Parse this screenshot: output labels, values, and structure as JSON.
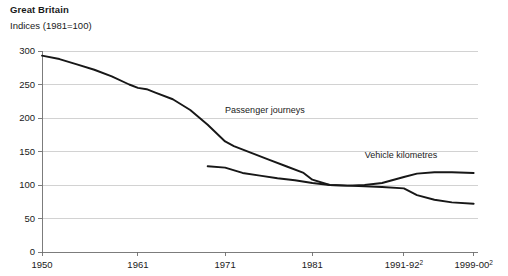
{
  "header": {
    "title": "Great Britain",
    "subtitle": "Indices (1981=100)"
  },
  "chart_data": {
    "type": "line",
    "title": "Great Britain",
    "subtitle": "Indices (1981=100)",
    "xlabel": "",
    "ylabel": "",
    "ylim": [
      0,
      300
    ],
    "yticks": [
      0,
      50,
      100,
      150,
      200,
      250,
      300
    ],
    "ytick_labels": [
      "0",
      "50",
      "100",
      "150",
      "200",
      "250",
      "300"
    ],
    "xticks": [
      1950,
      1961,
      1971,
      1981,
      1991.5,
      1999.5
    ],
    "xtick_labels": [
      "1950",
      "1961",
      "1971",
      "1981",
      "1991-92",
      "1999-00"
    ],
    "xtick_superscripts": [
      "",
      "",
      "",
      "",
      "2",
      "2"
    ],
    "xlim": [
      1950,
      2000
    ],
    "grid": "horizontal",
    "legend": "inline-annotations",
    "series": [
      {
        "name": "Passenger journeys",
        "label_x": 1971,
        "label_y": 208,
        "x": [
          1950,
          1952,
          1954,
          1956,
          1958,
          1960,
          1961,
          1962,
          1963,
          1965,
          1967,
          1969,
          1971,
          1972,
          1974,
          1976,
          1978,
          1980,
          1981,
          1983,
          1985,
          1987,
          1989,
          1991.5,
          1993,
          1995,
          1997,
          1999.5
        ],
        "y": [
          293,
          288,
          280,
          272,
          262,
          250,
          245,
          243,
          238,
          228,
          212,
          190,
          165,
          158,
          148,
          138,
          128,
          118,
          108,
          100,
          99,
          98,
          97,
          95,
          85,
          78,
          74,
          72
        ]
      },
      {
        "name": "Vehicle kilometres",
        "label_x": 1987,
        "label_y": 141,
        "x": [
          1969,
          1971,
          1973,
          1975,
          1977,
          1979,
          1981,
          1983,
          1985,
          1987,
          1989,
          1991.5,
          1993,
          1995,
          1997,
          1999.5
        ],
        "y": [
          128,
          126,
          118,
          114,
          110,
          107,
          103,
          100,
          99,
          100,
          103,
          112,
          117,
          119,
          119,
          118
        ]
      }
    ]
  },
  "axis": {
    "y_axis_name": "index-axis",
    "x_axis_name": "year-axis"
  }
}
